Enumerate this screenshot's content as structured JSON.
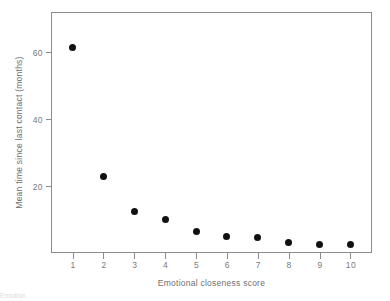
{
  "chart_data": {
    "type": "scatter",
    "title": "",
    "xlabel": "Emotional closeness score",
    "ylabel": "Mean time since last contact (months)",
    "x": [
      1,
      2,
      3,
      4,
      5,
      6,
      7,
      8,
      9,
      10
    ],
    "values": [
      61.5,
      23.0,
      12.5,
      10.0,
      6.5,
      5.0,
      4.5,
      3.0,
      2.5,
      2.5
    ],
    "xticks": [
      "1",
      "2",
      "3",
      "4",
      "5",
      "6",
      "7",
      "8",
      "9",
      "10"
    ],
    "yticks": [
      "20",
      "40",
      "60"
    ],
    "ytick_values": [
      20,
      40,
      60
    ],
    "xlim": [
      0.3,
      10.7
    ],
    "ylim": [
      0,
      72
    ],
    "grid": false,
    "legend": null,
    "marker": "filled-circle",
    "marker_color": "#111111",
    "axis_color": "#8c8c8c",
    "text_color": "#6f6f6f",
    "background": "#ffffff"
  },
  "figure": {
    "caption_fragment": "Emotion"
  }
}
